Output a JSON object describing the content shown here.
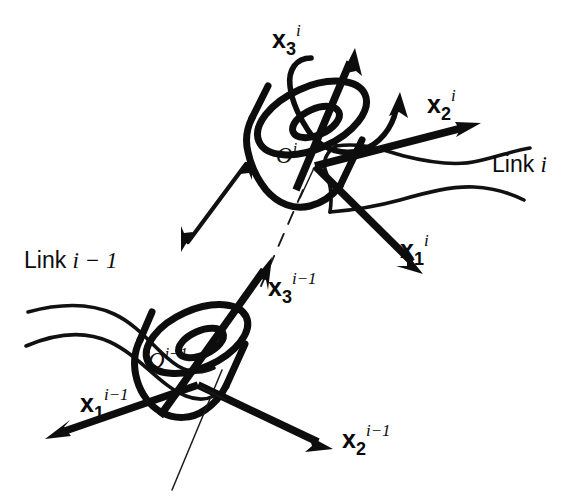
{
  "figure": {
    "background_color": "#ffffff",
    "ink_color": "#0d0d0d",
    "width": 588,
    "height": 500
  },
  "labels": {
    "x3_i": {
      "base": "x",
      "sub": "3",
      "sup": "i"
    },
    "x2_i": {
      "base": "x",
      "sub": "2",
      "sup": "i"
    },
    "x1_i": {
      "base": "x",
      "sub": "1",
      "sup": "i"
    },
    "x3_im1": {
      "base": "x",
      "sub": "3",
      "sup": "i−1"
    },
    "x2_im1": {
      "base": "x",
      "sub": "2",
      "sup": "i−1"
    },
    "x1_im1": {
      "base": "x",
      "sub": "1",
      "sup": "i−1"
    },
    "origin_i": {
      "base": "O",
      "sup": "i"
    },
    "origin_im1": {
      "base": "O",
      "sup": "i−1"
    },
    "link_i": {
      "prefix": "Link ",
      "index": "i"
    },
    "link_im1": {
      "prefix": "Link ",
      "index": "i − 1"
    }
  },
  "frames": [
    {
      "name": "frame-i",
      "origin_label": "O^i",
      "origin_point": [
        315,
        166
      ],
      "axes": [
        {
          "name": "x3",
          "label": "x_3^i",
          "tip": [
            355,
            52
          ],
          "kind": "arrow"
        },
        {
          "name": "x2",
          "label": "x_2^i",
          "tip": [
            478,
            122
          ],
          "kind": "arrow"
        },
        {
          "name": "x1",
          "label": "x_1^i",
          "tip": [
            420,
            272
          ],
          "kind": "arrow"
        }
      ]
    },
    {
      "name": "frame-i-minus-1",
      "origin_label": "O^{i-1}",
      "origin_point": [
        198,
        385
      ],
      "axes": [
        {
          "name": "x3",
          "label": "x_3^{i-1}",
          "tip": [
            270,
            258
          ],
          "kind": "arrow"
        },
        {
          "name": "x2",
          "label": "x_2^{i-1}",
          "tip": [
            330,
            450
          ],
          "kind": "arrow"
        },
        {
          "name": "x1",
          "label": "x_1^{i-1}",
          "tip": [
            48,
            440
          ],
          "kind": "arrow"
        }
      ]
    }
  ],
  "joint_motion": {
    "rotation": {
      "name": "rotation-arc-about-x3i",
      "description": "curved double arc encircling the x3^i axis indicating revolute rotation"
    },
    "translation": {
      "name": "translation-double-arrow",
      "description": "thin double-headed straight arrow parallel to the joint axis indicating prismatic sliding",
      "from": [
        182,
        245
      ],
      "to": [
        252,
        158
      ]
    }
  },
  "bodies": [
    {
      "name": "cylinder-upper",
      "label_ref": "O^i",
      "center": [
        306,
        150
      ]
    },
    {
      "name": "cylinder-lower",
      "label_ref": "O^{i-1}",
      "center": [
        190,
        370
      ]
    }
  ],
  "joint_axis_line": {
    "name": "joint-axis-dashed-line",
    "style": "dashed",
    "from": [
      300,
      196
    ],
    "to": [
      262,
      282
    ]
  }
}
